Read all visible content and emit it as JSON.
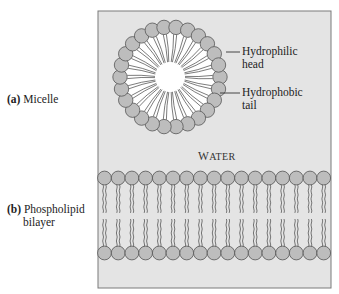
{
  "figure": {
    "panel_a": {
      "prefix": "(a)",
      "label": "Micelle"
    },
    "panel_b": {
      "prefix": "(b)",
      "label_line1": "Phospholipid",
      "label_line2": "bilayer"
    },
    "annotations": {
      "head_line1": "Hydrophilic",
      "head_line2": "head",
      "tail_line1": "Hydrophobic",
      "tail_line2": "tail"
    },
    "medium": {
      "first": "W",
      "rest": "ATER"
    },
    "micelle_head_count": 26,
    "bilayer_heads_per_row": 17
  },
  "colors": {
    "box_background": "#e4e4e4",
    "box_border": "#7a7a7a",
    "head_fill": "#bdbdbd",
    "head_stroke": "#555555",
    "tail_stroke": "#444444",
    "core": "#ffffff"
  }
}
